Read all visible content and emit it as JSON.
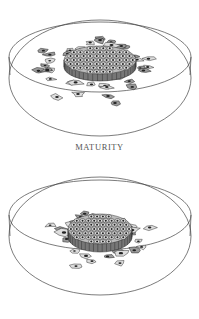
{
  "figure": {
    "caption": "MATURITY",
    "panels": [
      {
        "name": "dish-top",
        "stage": "mature colony with spreading cells"
      },
      {
        "name": "dish-bottom",
        "stage": "compact colony"
      }
    ]
  },
  "colors": {
    "background": "#ffffff",
    "line": "#444444",
    "caption": "#555555"
  }
}
